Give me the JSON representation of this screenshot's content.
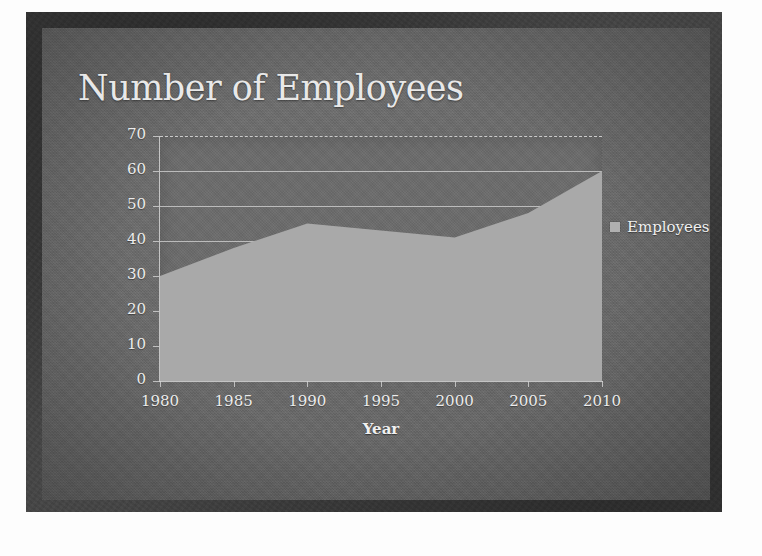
{
  "slide": {
    "title": "Number of Employees"
  },
  "legend": {
    "label": "Employees",
    "swatch_color": "#b0b0b0",
    "position": "right"
  },
  "axis": {
    "x_title": "Year"
  },
  "colors": {
    "slide_background": "#6a6a6a",
    "border": "#3a3a3a",
    "plot_background": "#6b6b6b",
    "area_fill": "#a9a9a9",
    "gridline": "#cfcfcf",
    "text": "#ececec",
    "title_text": "#e8e8e8"
  },
  "chart_data": {
    "type": "area",
    "title": "Number of Employees",
    "xlabel": "Year",
    "ylabel": "",
    "x": [
      1980,
      1985,
      1990,
      1995,
      2000,
      2005,
      2010
    ],
    "categories": [
      "1980",
      "1985",
      "1990",
      "1995",
      "2000",
      "2005",
      "2010"
    ],
    "series": [
      {
        "name": "Employees",
        "values": [
          30,
          38,
          45,
          43,
          41,
          48,
          60
        ]
      }
    ],
    "xlim": [
      1980,
      2010
    ],
    "ylim": [
      0,
      70
    ],
    "ytick_labels": [
      "0",
      "10",
      "20",
      "30",
      "40",
      "50",
      "60",
      "70"
    ],
    "yticks": [
      0,
      10,
      20,
      30,
      40,
      50,
      60,
      70
    ],
    "xtick_labels": [
      "1980",
      "1985",
      "1990",
      "1995",
      "2000",
      "2005",
      "2010"
    ],
    "grid": "horizontal",
    "legend_position": "right"
  }
}
